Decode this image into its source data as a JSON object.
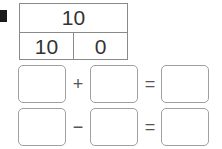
{
  "exercise": {
    "marker": "square-marker",
    "number_bond": {
      "whole": "10",
      "parts": [
        "10",
        "0"
      ]
    },
    "equations": [
      {
        "operator": "+",
        "equals": "=",
        "blanks": [
          "",
          "",
          ""
        ]
      },
      {
        "operator": "−",
        "equals": "=",
        "blanks": [
          "",
          "",
          ""
        ]
      }
    ]
  }
}
